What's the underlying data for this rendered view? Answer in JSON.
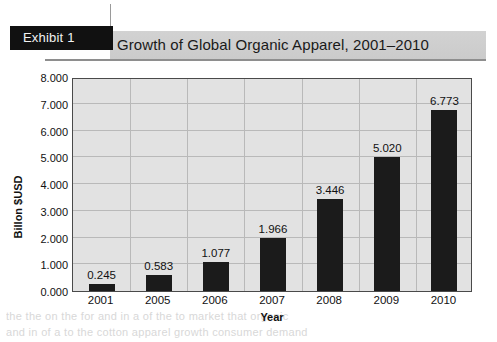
{
  "exhibit": {
    "label": "Exhibit 1"
  },
  "header": {
    "title": "Growth of Global Organic Apparel, 2001–2010"
  },
  "page_bleed": {
    "line1": "the the on the for and in a of the to market that organic",
    "line2": "and in of a to the cotton apparel growth consumer demand",
    "right": "in the organic"
  },
  "chart_data": {
    "type": "bar",
    "title": "Growth of Global Organic Apparel, 2001–2010",
    "xlabel": "Year",
    "ylabel": "Billon $USD",
    "ylim": [
      0,
      8
    ],
    "ytick_step": 1,
    "ytick_labels": [
      "8.000",
      "7.000",
      "6.000",
      "5.000",
      "4.000",
      "3.000",
      "2.000",
      "1.000",
      "0.000"
    ],
    "ytick_values": [
      8,
      7,
      6,
      5,
      4,
      3,
      2,
      1,
      0
    ],
    "grid": "both",
    "legend": "none",
    "bar_color": "#1b1b1b",
    "plot_background": "#e2e2e2",
    "categories": [
      "2001",
      "2005",
      "2006",
      "2007",
      "2008",
      "2009",
      "2010"
    ],
    "values": [
      0.245,
      0.583,
      1.077,
      1.966,
      3.446,
      5.02,
      6.773
    ],
    "value_labels": [
      "0.245",
      "0.583",
      "1.077",
      "1.966",
      "3.446",
      "5.020",
      "6.773"
    ]
  }
}
